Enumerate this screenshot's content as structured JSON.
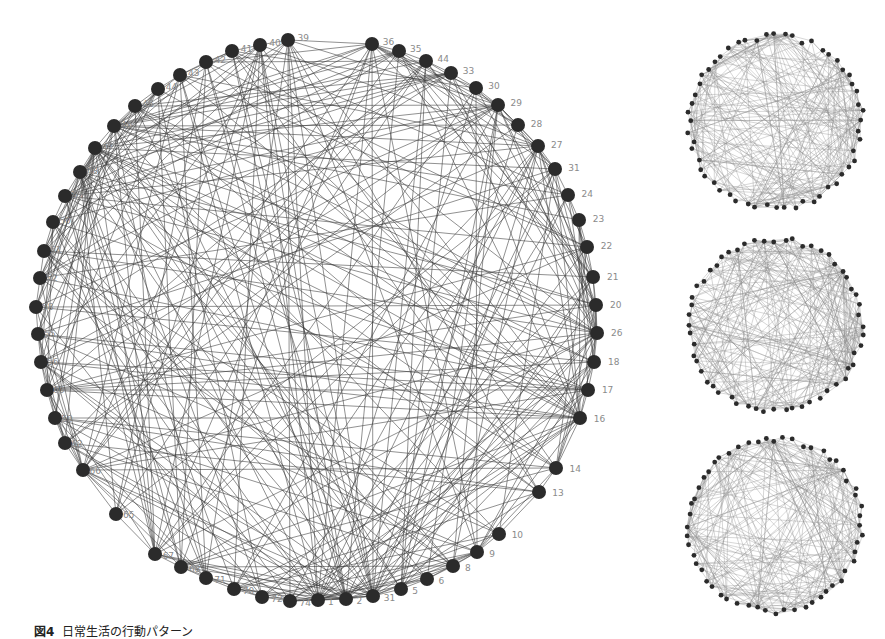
{
  "caption": {
    "figure_label": "図4",
    "text": "日常生活の行動パターン"
  },
  "colors": {
    "node": "#2b2b2b",
    "edge": "#3a3a3a",
    "label": "#8a8a8a",
    "mini_edge": "#8c8c8c",
    "background": "#ffffff"
  },
  "main_graph": {
    "center": [
      318,
      330
    ],
    "radius": 285,
    "node_radius": 7,
    "nodes": [
      {
        "id": "36",
        "x": 372,
        "y": 44
      },
      {
        "id": "35",
        "x": 399,
        "y": 51
      },
      {
        "id": "44",
        "x": 426,
        "y": 61
      },
      {
        "id": "33",
        "x": 451,
        "y": 73
      },
      {
        "id": "30",
        "x": 476,
        "y": 88
      },
      {
        "id": "29",
        "x": 498,
        "y": 105
      },
      {
        "id": "28",
        "x": 518,
        "y": 125
      },
      {
        "id": "27",
        "x": 538,
        "y": 146
      },
      {
        "id": "31",
        "x": 555,
        "y": 169
      },
      {
        "id": "24",
        "x": 568,
        "y": 195
      },
      {
        "id": "23",
        "x": 579,
        "y": 220
      },
      {
        "id": "22",
        "x": 587,
        "y": 247
      },
      {
        "id": "21",
        "x": 593,
        "y": 277
      },
      {
        "id": "20",
        "x": 596,
        "y": 305
      },
      {
        "id": "26",
        "x": 597,
        "y": 333
      },
      {
        "id": "18",
        "x": 594,
        "y": 362
      },
      {
        "id": "17",
        "x": 588,
        "y": 390
      },
      {
        "id": "16",
        "x": 580,
        "y": 418
      },
      {
        "id": "14",
        "x": 556,
        "y": 468
      },
      {
        "id": "13",
        "x": 539,
        "y": 492
      },
      {
        "id": "10",
        "x": 499,
        "y": 534
      },
      {
        "id": "9",
        "x": 477,
        "y": 552
      },
      {
        "id": "8",
        "x": 453,
        "y": 566
      },
      {
        "id": "6",
        "x": 427,
        "y": 579
      },
      {
        "id": "5",
        "x": 401,
        "y": 589
      },
      {
        "id": "31",
        "x": 373,
        "y": 596
      },
      {
        "id": "2",
        "x": 346,
        "y": 599
      },
      {
        "id": "1",
        "x": 318,
        "y": 600
      },
      {
        "id": "74",
        "x": 290,
        "y": 601
      },
      {
        "id": "72",
        "x": 262,
        "y": 597
      },
      {
        "id": "70",
        "x": 234,
        "y": 589
      },
      {
        "id": "71",
        "x": 206,
        "y": 578
      },
      {
        "id": "68",
        "x": 181,
        "y": 567
      },
      {
        "id": "67",
        "x": 155,
        "y": 554
      },
      {
        "id": "65",
        "x": 116,
        "y": 514
      },
      {
        "id": "66",
        "x": 83,
        "y": 470
      },
      {
        "id": "62",
        "x": 65,
        "y": 443
      },
      {
        "id": "59",
        "x": 55,
        "y": 418
      },
      {
        "id": "60",
        "x": 47,
        "y": 390
      },
      {
        "id": "56",
        "x": 41,
        "y": 362
      },
      {
        "id": "55",
        "x": 38,
        "y": 334
      },
      {
        "id": "58",
        "x": 36,
        "y": 307
      },
      {
        "id": "52",
        "x": 40,
        "y": 278
      },
      {
        "id": "51",
        "x": 44,
        "y": 251
      },
      {
        "id": "50",
        "x": 53,
        "y": 222
      },
      {
        "id": "53",
        "x": 65,
        "y": 196
      },
      {
        "id": "48",
        "x": 80,
        "y": 172
      },
      {
        "id": "47",
        "x": 95,
        "y": 148
      },
      {
        "id": "46",
        "x": 114,
        "y": 126
      },
      {
        "id": "45",
        "x": 135,
        "y": 106
      },
      {
        "id": "44b",
        "label": "44",
        "x": 158,
        "y": 89
      },
      {
        "id": "43",
        "x": 180,
        "y": 75
      },
      {
        "id": "42",
        "x": 206,
        "y": 62
      },
      {
        "id": "41",
        "x": 232,
        "y": 51
      },
      {
        "id": "40",
        "x": 260,
        "y": 45
      },
      {
        "id": "39",
        "x": 288,
        "y": 40
      }
    ],
    "hubs": [
      "36",
      "16",
      "26",
      "27",
      "29",
      "1",
      "2",
      "66",
      "48",
      "46",
      "47",
      "31"
    ]
  },
  "mini_graphs": [
    {
      "name": "pattern-1",
      "node_count": 56,
      "seed": 7
    },
    {
      "name": "pattern-2",
      "node_count": 56,
      "seed": 19
    },
    {
      "name": "pattern-3",
      "node_count": 56,
      "seed": 31
    }
  ]
}
